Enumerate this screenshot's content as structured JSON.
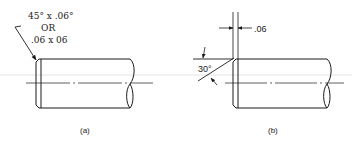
{
  "figure": {
    "type": "technical-drawing",
    "colors": {
      "line": "#1a1a1a",
      "background": "#ffffff",
      "guide": "#d8d8d8"
    }
  },
  "panel_a": {
    "label": "(a)",
    "note_line1": "45° x .06°",
    "note_line2": "OR",
    "note_line3": ".06 x 06"
  },
  "panel_b": {
    "label": "(b)",
    "dimension": ".06",
    "angle": "30°"
  }
}
